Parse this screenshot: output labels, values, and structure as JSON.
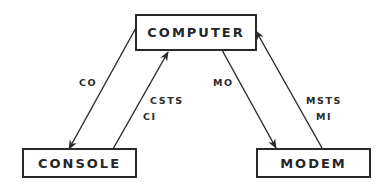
{
  "diagram": {
    "nodes": {
      "computer": {
        "label": "COMPUTER"
      },
      "console": {
        "label": "CONSOLE"
      },
      "modem": {
        "label": "MODEM"
      }
    },
    "edges": [
      {
        "from": "computer",
        "to": "console",
        "labels": [
          "CO"
        ]
      },
      {
        "from": "console",
        "to": "computer",
        "labels": [
          "CSTS",
          "CI"
        ]
      },
      {
        "from": "computer",
        "to": "modem",
        "labels": [
          "MO"
        ]
      },
      {
        "from": "modem",
        "to": "computer",
        "labels": [
          "MSTS",
          "MI"
        ]
      }
    ],
    "edge_labels": {
      "co": "CO",
      "csts": "CSTS",
      "ci": "CI",
      "mo": "MO",
      "msts": "MSTS",
      "mi": "MI"
    },
    "colors": {
      "line": "#2a2a2a",
      "text": "#262626",
      "background": "#ffffff"
    }
  }
}
